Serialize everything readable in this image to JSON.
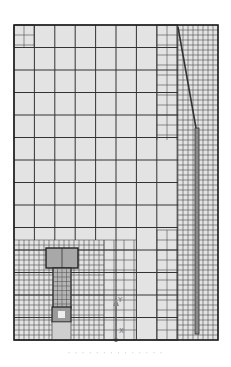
{
  "figure": {
    "type": "finite-element mesh",
    "frame": {
      "x": 14,
      "y": 25,
      "width": 204,
      "height": 315
    },
    "colors": {
      "background": "#ffffff",
      "mesh_fill": "#e3e3e3",
      "grid_line": "#333333",
      "fine_line": "#4a4a4a",
      "object_fill": "#b5b5b5",
      "object_head_fill": "#a8a8a8",
      "base_fill": "#cfcfcf"
    },
    "coarse_grid": {
      "dx": 20.4,
      "dy": 22.5
    },
    "fine_grid_step": 5,
    "axis_triad": {
      "y_label": "Y",
      "x_label": "X"
    },
    "caption": "· · · · · · · · · · · · · ·"
  }
}
